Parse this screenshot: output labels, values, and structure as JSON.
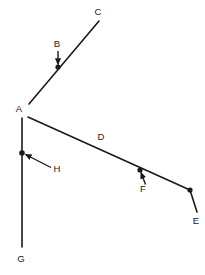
{
  "diagram": {
    "type": "line-segment-geometry-figure",
    "background_color": "#ffffff",
    "stroke_color": "#1a1a1a",
    "label_color": "#1a1a1a",
    "stroke_width": 1.6,
    "arrow_stroke_width": 1.4,
    "point_radius": 2.6,
    "labels": {
      "a": "A",
      "b": "B",
      "c": "C",
      "d": "D",
      "e": "E",
      "f": "F",
      "g": "G",
      "h": "H"
    },
    "label_positions": {
      "a": {
        "x": 19,
        "y": 109
      },
      "b": {
        "x": 57,
        "y": 44
      },
      "c": {
        "x": 98,
        "y": 12
      },
      "d": {
        "x": 101,
        "y": 137
      },
      "e": {
        "x": 196,
        "y": 221
      },
      "f": {
        "x": 143,
        "y": 189
      },
      "g": {
        "x": 21,
        "y": 259
      },
      "h": {
        "x": 57,
        "y": 169
      }
    },
    "vertices": {
      "a": {
        "x": 25,
        "y": 115
      },
      "c": {
        "x": 99,
        "y": 21
      },
      "g": {
        "x": 22,
        "y": 247
      },
      "e": {
        "x": 197,
        "y": 212
      },
      "bend": {
        "x": 190,
        "y": 190
      }
    },
    "marked_points": {
      "b": {
        "x": 58,
        "y": 67
      },
      "f": {
        "x": 140,
        "y": 170
      },
      "h": {
        "x": 22,
        "y": 153
      },
      "e_bend": {
        "x": 190,
        "y": 190
      }
    },
    "segments": [
      {
        "name": "segment-a-c",
        "from": {
          "x": 29,
          "y": 104
        },
        "to": {
          "x": 99,
          "y": 21
        }
      },
      {
        "name": "segment-a-g",
        "from": {
          "x": 22,
          "y": 118
        },
        "to": {
          "x": 22,
          "y": 247
        }
      },
      {
        "name": "segment-a-e",
        "from": {
          "x": 28,
          "y": 117
        },
        "to": {
          "x": 190,
          "y": 190
        }
      },
      {
        "name": "segment-bend-e",
        "from": {
          "x": 190,
          "y": 190
        },
        "to": {
          "x": 197,
          "y": 212
        }
      }
    ],
    "leaders": [
      {
        "name": "leader-b",
        "from": {
          "x": 58,
          "y": 51
        },
        "to": {
          "x": 58,
          "y": 66
        }
      },
      {
        "name": "leader-f",
        "from": {
          "x": 145,
          "y": 184
        },
        "to": {
          "x": 140,
          "y": 171
        }
      },
      {
        "name": "leader-h",
        "from": {
          "x": 50,
          "y": 167
        },
        "to": {
          "x": 24,
          "y": 154
        }
      }
    ]
  }
}
